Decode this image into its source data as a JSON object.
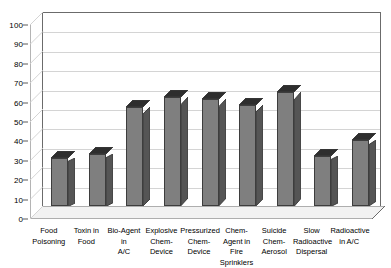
{
  "chart_data": {
    "type": "bar",
    "title": "",
    "subtitle": "",
    "xlabel": "",
    "ylabel": "",
    "ylim": [
      0,
      100
    ],
    "ytick_step": 10,
    "yticks": [
      0,
      10,
      20,
      30,
      40,
      50,
      60,
      70,
      80,
      90,
      100
    ],
    "grid": true,
    "legend": false,
    "legend_position": "none",
    "style": "3d-column",
    "bar_color": "#7f7f7f",
    "bar_side_color": "#555555",
    "bar_top_color": "#2e2e2e",
    "bar_edge_color": "#3d3d3d",
    "gridline_color": "#d4d4d4",
    "axis_color": "#6b6b6b",
    "background_color": "#ffffff",
    "categories": [
      "Food Poisoning",
      "Toxin in Food",
      "Bio-Agent in A/C",
      "Explosive Chem-Device",
      "Pressurized Chem-Device",
      "Chem-Agent in Fire Sprinklers",
      "Suicide Chem-Aerosol",
      "Slow Radioactive Dispersal",
      "Radioactive in A/C"
    ],
    "category_lines": [
      [
        "Food",
        "Poisoning"
      ],
      [
        "Toxin in",
        "Food"
      ],
      [
        "Bio-Agent in",
        "A/C"
      ],
      [
        "Explosive",
        "Chem-",
        "Device"
      ],
      [
        "Pressurized",
        "Chem-",
        "Device"
      ],
      [
        "Chem-",
        "Agent in",
        "Fire",
        "Sprinklers"
      ],
      [
        "Suicide",
        "Chem-",
        "Aerosol"
      ],
      [
        "Slow",
        "Radioactive",
        "Dispersal"
      ],
      [
        "Radioactive",
        "in A/C"
      ]
    ],
    "values": [
      25,
      27,
      51,
      56,
      55,
      52,
      59,
      26,
      34
    ]
  }
}
